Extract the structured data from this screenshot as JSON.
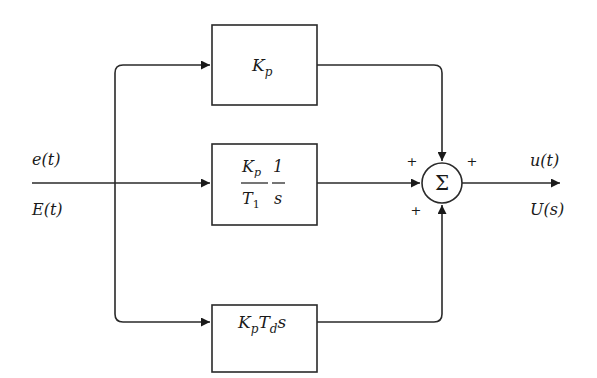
{
  "diagram": {
    "input": {
      "time_label": "e(t)",
      "laplace_label": "E(t)"
    },
    "output": {
      "time_label": "u(t)",
      "laplace_label": "U(s)"
    },
    "blocks": [
      {
        "id": "proportional",
        "label": "Kp",
        "main": "K",
        "sub": "p"
      },
      {
        "id": "integral",
        "label": "Kp/T1 · 1/s",
        "num1_main": "K",
        "num1_sub": "p",
        "den1_main": "T",
        "den1_sub": "1",
        "num2": "1",
        "den2": "s"
      },
      {
        "id": "derivative",
        "label": "Kp Td s",
        "k_main": "K",
        "k_sub": "p",
        "t_main": "T",
        "t_sub": "d",
        "s": "s"
      }
    ],
    "summing_junction": {
      "symbol": "Σ",
      "signs": [
        "+",
        "+",
        "+",
        "+"
      ]
    },
    "colors": {
      "line": "#2a2a2a",
      "background": "#ffffff"
    }
  }
}
